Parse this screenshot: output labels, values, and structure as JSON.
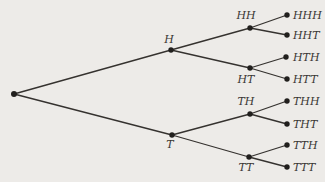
{
  "colors": {
    "background": "#edebe8",
    "edge": "#35322f",
    "node_dot": "#211f1d",
    "label_text": "#3a3734"
  },
  "diagram": {
    "type": "tree",
    "width": 325,
    "height": 182,
    "nodes": [
      {
        "id": "root",
        "x": 14,
        "y": 94,
        "r": 3,
        "label": ""
      },
      {
        "id": "H",
        "x": 171,
        "y": 50,
        "r": 2.7,
        "label": "H",
        "lx": 169,
        "ly": 43,
        "anchor": "middle"
      },
      {
        "id": "T",
        "x": 172,
        "y": 135,
        "r": 2.7,
        "label": "T",
        "lx": 170,
        "ly": 148,
        "anchor": "middle"
      },
      {
        "id": "HH",
        "x": 250,
        "y": 28,
        "r": 2.7,
        "label": "HH",
        "lx": 246,
        "ly": 19,
        "anchor": "middle"
      },
      {
        "id": "HT",
        "x": 250,
        "y": 68,
        "r": 2.7,
        "label": "HT",
        "lx": 246,
        "ly": 83,
        "anchor": "middle"
      },
      {
        "id": "TH",
        "x": 250,
        "y": 114,
        "r": 2.7,
        "label": "TH",
        "lx": 246,
        "ly": 105,
        "anchor": "middle"
      },
      {
        "id": "TT",
        "x": 249,
        "y": 157,
        "r": 2.7,
        "label": "TT",
        "lx": 246,
        "ly": 171,
        "anchor": "middle"
      },
      {
        "id": "HHH",
        "x": 287,
        "y": 15,
        "r": 2.7,
        "label": "HHH",
        "lx": 293,
        "ly": 19,
        "anchor": "start"
      },
      {
        "id": "HHT",
        "x": 287,
        "y": 35,
        "r": 2.7,
        "label": "HHT",
        "lx": 293,
        "ly": 39,
        "anchor": "start"
      },
      {
        "id": "HTH",
        "x": 286,
        "y": 57,
        "r": 2.7,
        "label": "HTH",
        "lx": 293,
        "ly": 61,
        "anchor": "start"
      },
      {
        "id": "HTT",
        "x": 287,
        "y": 79,
        "r": 2.7,
        "label": "HTT",
        "lx": 293,
        "ly": 83,
        "anchor": "start"
      },
      {
        "id": "THH",
        "x": 287,
        "y": 101,
        "r": 2.7,
        "label": "THH",
        "lx": 293,
        "ly": 105,
        "anchor": "start"
      },
      {
        "id": "THT",
        "x": 287,
        "y": 124,
        "r": 2.7,
        "label": "THT",
        "lx": 293,
        "ly": 128,
        "anchor": "start"
      },
      {
        "id": "TTH",
        "x": 287,
        "y": 145,
        "r": 2.7,
        "label": "TTH",
        "lx": 293,
        "ly": 149,
        "anchor": "start"
      },
      {
        "id": "TTT",
        "x": 287,
        "y": 167,
        "r": 2.7,
        "label": "TTT",
        "lx": 293,
        "ly": 171,
        "anchor": "start"
      }
    ],
    "edges": [
      [
        "root",
        "H"
      ],
      [
        "root",
        "T"
      ],
      [
        "H",
        "HH"
      ],
      [
        "H",
        "HT"
      ],
      [
        "T",
        "TH"
      ],
      [
        "T",
        "TT"
      ],
      [
        "HH",
        "HHH"
      ],
      [
        "HH",
        "HHT"
      ],
      [
        "HT",
        "HTH"
      ],
      [
        "HT",
        "HTT"
      ],
      [
        "TH",
        "THH"
      ],
      [
        "TH",
        "THT"
      ],
      [
        "TT",
        "TTH"
      ],
      [
        "TT",
        "TTT"
      ]
    ]
  }
}
